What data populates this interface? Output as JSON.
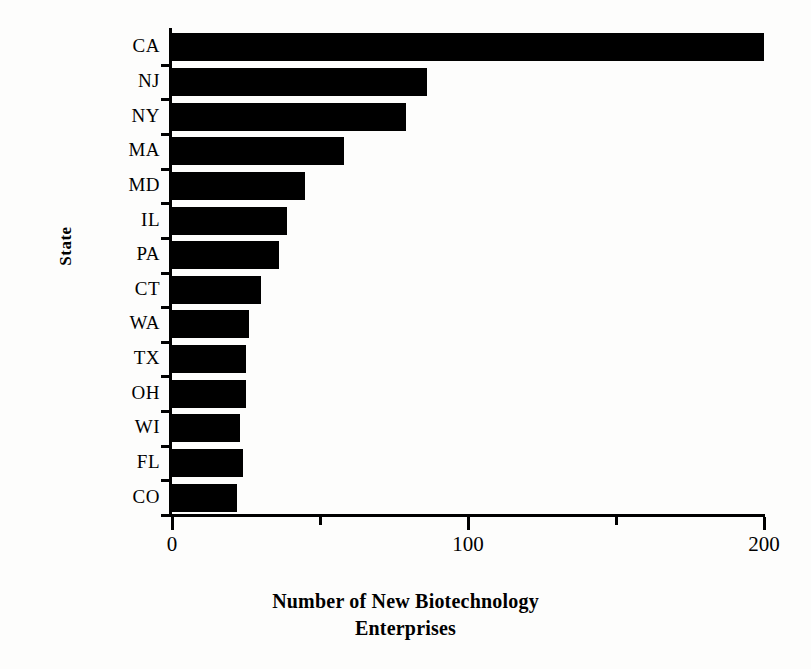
{
  "chart_data": {
    "type": "bar",
    "orientation": "horizontal",
    "title": "",
    "xlabel": "Number of New Biotechnology Enterprises",
    "ylabel": "State",
    "categories": [
      "CA",
      "NJ",
      "NY",
      "MA",
      "MD",
      "IL",
      "PA",
      "CT",
      "WA",
      "TX",
      "OH",
      "WI",
      "FL",
      "CO"
    ],
    "values": [
      200,
      86,
      79,
      58,
      45,
      39,
      36,
      30,
      26,
      25,
      25,
      23,
      24,
      22
    ],
    "xlim": [
      0,
      200
    ],
    "xticks": [
      0,
      50,
      100,
      150,
      200
    ],
    "xtick_labels": [
      "0",
      "",
      "100",
      "",
      "200"
    ],
    "grid": false,
    "legend": null,
    "bar_color": "#000000",
    "background_color": "#ffffff"
  },
  "figure": {
    "title_fragment": "",
    "x_axis_title_line1": "Number of New Biotechnology",
    "x_axis_title_line2": "Enterprises",
    "y_axis_title": "State"
  }
}
